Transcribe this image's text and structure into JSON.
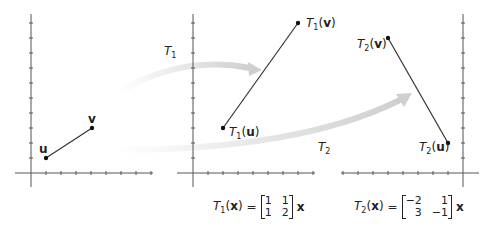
{
  "arrows": [
    {
      "label": "T",
      "sub": "1"
    },
    {
      "label": "T",
      "sub": "2"
    }
  ],
  "plot1": {
    "u_label": "u",
    "v_label": "v",
    "u": [
      1,
      1
    ],
    "v": [
      4,
      3
    ]
  },
  "plot2": {
    "u_label_fn": "T",
    "u_sub": "1",
    "u_arg": "u",
    "v_label_fn": "T",
    "v_sub": "1",
    "v_arg": "v",
    "u": [
      2,
      3
    ],
    "v": [
      7,
      10
    ]
  },
  "plot3": {
    "u_label_fn": "T",
    "u_sub": "2",
    "u_arg": "u",
    "v_label_fn": "T",
    "v_sub": "2",
    "v_arg": "v",
    "u": [
      -1,
      2
    ],
    "v": [
      -5,
      9
    ]
  },
  "equations": [
    {
      "fn": "T",
      "sub": "1",
      "arg": "x",
      "eq": "=",
      "matrix": [
        "1",
        "1",
        "1",
        "2"
      ],
      "vec": "x"
    },
    {
      "fn": "T",
      "sub": "2",
      "arg": "x",
      "eq": "=",
      "matrix": [
        "−2",
        "1",
        "3",
        "−1"
      ],
      "vec": "x"
    }
  ],
  "colors": {
    "axis": "#555555",
    "segment": "#333333",
    "arrow": "#d8d8d8"
  }
}
